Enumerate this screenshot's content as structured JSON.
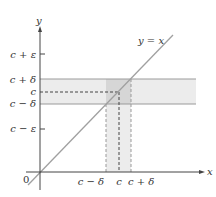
{
  "figure": {
    "axes": {
      "x_label": "x",
      "y_label": "y",
      "origin_label": "0"
    },
    "line_label": "y = x",
    "y_ticks": {
      "c_plus_eps": "c + ε",
      "c_plus_delta": "c + δ",
      "c": "c",
      "c_minus_delta": "c − δ",
      "c_minus_eps": "c − ε"
    },
    "x_ticks": {
      "c_minus_delta": "c − δ",
      "c": "c",
      "c_plus_delta": "c + δ"
    },
    "colors": {
      "axis": "#444444",
      "diagonal": "#a0a0a0",
      "band_fill": "#ececec",
      "overlap_fill": "#d6d6d6",
      "band_edge": "#9a9a9a"
    }
  }
}
